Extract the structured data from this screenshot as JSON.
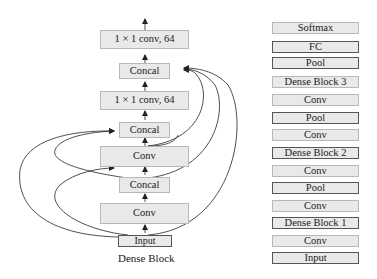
{
  "dense_block": {
    "caption": "Dense Block",
    "nodes": [
      {
        "id": "conv1x1_top",
        "label": "1 × 1 conv, 64"
      },
      {
        "id": "concat_4",
        "label": "Concal"
      },
      {
        "id": "conv1x1_mid",
        "label": "1 × 1 conv, 64"
      },
      {
        "id": "concat_3",
        "label": "Concal"
      },
      {
        "id": "conv_2",
        "label": "Conv"
      },
      {
        "id": "concat_2",
        "label": "Concal"
      },
      {
        "id": "conv_1",
        "label": "Conv"
      },
      {
        "id": "input",
        "label": "Input"
      }
    ]
  },
  "network": {
    "layers": [
      {
        "label": "Softmax",
        "style": "light"
      },
      {
        "label": "FC",
        "style": "dark"
      },
      {
        "label": "Pool",
        "style": "dark"
      },
      {
        "label": "Dense Block 3",
        "style": "light"
      },
      {
        "label": "Conv",
        "style": "light"
      },
      {
        "label": "Pool",
        "style": "dark"
      },
      {
        "label": "Conv",
        "style": "light"
      },
      {
        "label": "Dense Block 2",
        "style": "dark"
      },
      {
        "label": "Conv",
        "style": "light"
      },
      {
        "label": "Pool",
        "style": "dark"
      },
      {
        "label": "Conv",
        "style": "light"
      },
      {
        "label": "Dense Block 1",
        "style": "dark"
      },
      {
        "label": "Conv",
        "style": "light"
      },
      {
        "label": "Input",
        "style": "dark"
      }
    ]
  },
  "colors": {
    "box_fill": "#e9e9e9",
    "box_border_light": "#b8b8b8",
    "box_border_dark": "#555555",
    "line": "#222222"
  }
}
